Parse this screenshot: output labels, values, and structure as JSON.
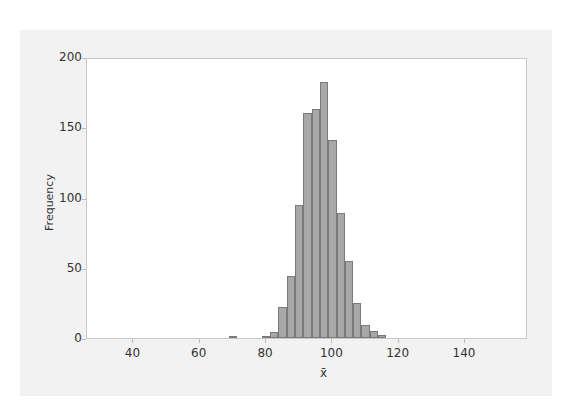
{
  "chart_data": {
    "type": "bar",
    "subtype": "histogram",
    "title": "",
    "xlabel": "x̄",
    "ylabel": "Frequency",
    "xlim": [
      26,
      159
    ],
    "ylim": [
      0,
      200
    ],
    "x_ticks": [
      40,
      60,
      80,
      100,
      120,
      140
    ],
    "y_ticks": [
      0,
      50,
      100,
      150,
      200
    ],
    "grid": false,
    "legend": null,
    "bin_width": 2.5,
    "bins": [
      {
        "start": 68.75,
        "end": 71.25,
        "count": 1
      },
      {
        "start": 78.75,
        "end": 81.25,
        "count": 1
      },
      {
        "start": 81.25,
        "end": 83.75,
        "count": 4
      },
      {
        "start": 83.75,
        "end": 86.25,
        "count": 22
      },
      {
        "start": 86.25,
        "end": 88.75,
        "count": 44
      },
      {
        "start": 88.75,
        "end": 91.25,
        "count": 95
      },
      {
        "start": 91.25,
        "end": 93.75,
        "count": 160
      },
      {
        "start": 93.75,
        "end": 96.25,
        "count": 163
      },
      {
        "start": 96.25,
        "end": 98.75,
        "count": 182
      },
      {
        "start": 98.75,
        "end": 101.25,
        "count": 141
      },
      {
        "start": 101.25,
        "end": 103.75,
        "count": 89
      },
      {
        "start": 103.75,
        "end": 106.25,
        "count": 55
      },
      {
        "start": 106.25,
        "end": 108.75,
        "count": 25
      },
      {
        "start": 108.75,
        "end": 111.25,
        "count": 9
      },
      {
        "start": 111.25,
        "end": 113.75,
        "count": 5
      },
      {
        "start": 113.75,
        "end": 116.25,
        "count": 2
      }
    ],
    "categories": [
      70,
      80,
      82.5,
      85,
      87.5,
      90,
      92.5,
      95,
      97.5,
      100,
      102.5,
      105,
      107.5,
      110,
      112.5,
      115
    ],
    "values": [
      1,
      1,
      4,
      22,
      44,
      95,
      160,
      163,
      182,
      141,
      89,
      55,
      25,
      9,
      5,
      2
    ],
    "colors": {
      "bar_fill": "#a8a8a8",
      "bar_edge": "#7a7a7a",
      "panel_bg": "#f2f2f2",
      "plot_bg": "#ffffff"
    }
  },
  "axis": {
    "y_ticks": [
      "0",
      "50",
      "100",
      "150",
      "200"
    ],
    "x_ticks": [
      "40",
      "60",
      "80",
      "100",
      "120",
      "140"
    ],
    "xlabel": "x̄",
    "ylabel": "Frequency"
  }
}
